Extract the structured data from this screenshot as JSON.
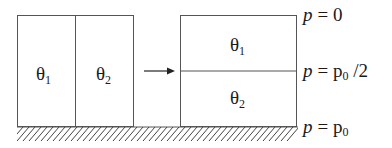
{
  "diagram": {
    "left_box": {
      "cells": [
        {
          "symbol": "θ",
          "subscript": "1"
        },
        {
          "symbol": "θ",
          "subscript": "2"
        }
      ]
    },
    "right_box": {
      "cells": [
        {
          "symbol": "θ",
          "subscript": "1"
        },
        {
          "symbol": "θ",
          "subscript": "2"
        }
      ]
    },
    "arrow": "right-arrow",
    "pressure_labels": {
      "top": {
        "var": "p",
        "eq": "= 0",
        "sub": "",
        "suffix": ""
      },
      "middle": {
        "var": "p",
        "eq": "= p",
        "sub": "0",
        "suffix": " /2"
      },
      "bottom": {
        "var": "p",
        "eq": "= p",
        "sub": "0",
        "suffix": ""
      }
    },
    "ground": "hatched-ground",
    "colors": {
      "line": "#3a3a3a",
      "text": "#1a1a1a",
      "background": "#ffffff"
    }
  }
}
